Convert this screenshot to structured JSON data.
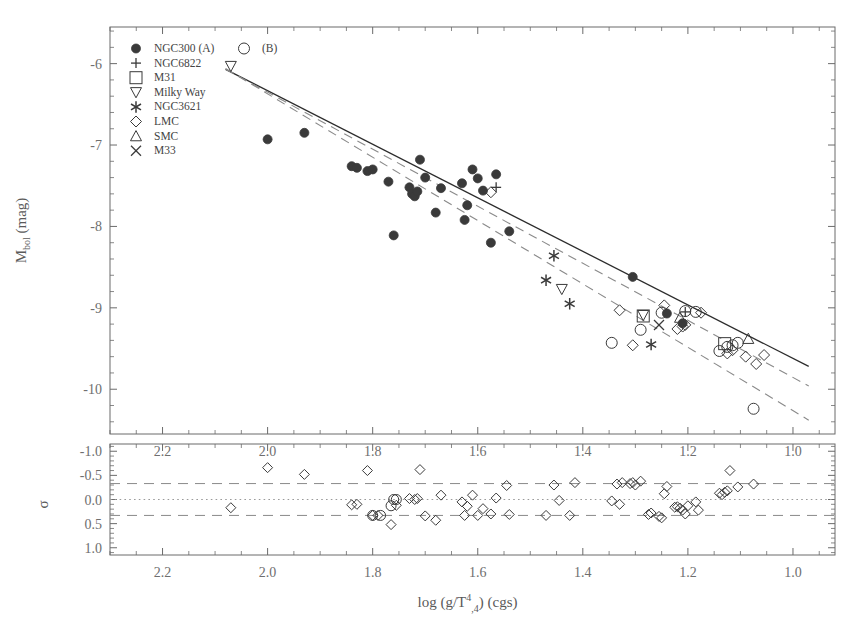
{
  "figure": {
    "title": "",
    "background": "#ffffff",
    "ink": "#3a3a3a"
  },
  "legend": {
    "position": "top-left-inside",
    "entries": [
      {
        "marker": "filled-circle",
        "label": "NGC300 (A)"
      },
      {
        "marker": "plus",
        "label": "NGC6822"
      },
      {
        "marker": "square",
        "label": "M31"
      },
      {
        "marker": "triangle-down",
        "label": "Milky Way"
      },
      {
        "marker": "asterisk",
        "label": "NGC3621"
      },
      {
        "marker": "diamond",
        "label": "LMC"
      },
      {
        "marker": "triangle-up",
        "label": "SMC"
      },
      {
        "marker": "cross",
        "label": "M33"
      }
    ],
    "extra": {
      "marker": "open-circle",
      "label": "(B)"
    }
  },
  "chart_data": [
    {
      "type": "scatter",
      "panel": "main",
      "title": "",
      "xlabel": "log (g/T⁴,4)  (cgs)",
      "ylabel": "M_bol (mag)",
      "xlabel_parts": {
        "pre": "log (g/T",
        "sup": "4",
        "sub": ",4",
        "post": ")  (cgs)"
      },
      "ylabel_parts": {
        "pre": "M",
        "sub": "bol",
        "post": " (mag)"
      },
      "xlim": [
        2.3,
        0.92
      ],
      "ylim": [
        -5.55,
        -10.55
      ],
      "x_ticks": [
        2.2,
        2.0,
        1.8,
        1.6,
        1.4,
        1.2,
        1.0
      ],
      "y_ticks": [
        -10,
        -9,
        -8,
        -7,
        -6
      ],
      "x_minor_step": 0.05,
      "y_minor_step": 0.2,
      "grid": false,
      "inverted_x": true,
      "inverted_y": true,
      "fit_lines": [
        {
          "name": "best-fit",
          "style": "solid",
          "color": "#2c2c2c",
          "x1": 2.08,
          "y1": -6.07,
          "x2": 0.97,
          "y2": -9.72
        },
        {
          "name": "comparison-A",
          "style": "dashed",
          "color": "#8a8a8a",
          "x1": 2.08,
          "y1": -6.07,
          "x2": 0.97,
          "y2": -9.96
        },
        {
          "name": "comparison-B",
          "style": "dashed",
          "color": "#8a8a8a",
          "x1": 2.08,
          "y1": -6.06,
          "x2": 0.97,
          "y2": -10.38
        }
      ],
      "series": [
        {
          "name": "NGC300 (A)",
          "marker": "filled-circle",
          "points": [
            [
              2.0,
              -6.93
            ],
            [
              1.93,
              -6.85
            ],
            [
              1.84,
              -7.26
            ],
            [
              1.83,
              -7.28
            ],
            [
              1.81,
              -7.32
            ],
            [
              1.8,
              -7.3
            ],
            [
              1.77,
              -7.45
            ],
            [
              1.76,
              -8.11
            ],
            [
              1.73,
              -7.52
            ],
            [
              1.725,
              -7.6
            ],
            [
              1.72,
              -7.63
            ],
            [
              1.715,
              -7.57
            ],
            [
              1.71,
              -7.18
            ],
            [
              1.7,
              -7.4
            ],
            [
              1.68,
              -7.83
            ],
            [
              1.67,
              -7.53
            ],
            [
              1.63,
              -7.47
            ],
            [
              1.625,
              -7.92
            ],
            [
              1.62,
              -7.74
            ],
            [
              1.61,
              -7.3
            ],
            [
              1.6,
              -7.41
            ],
            [
              1.59,
              -7.56
            ],
            [
              1.575,
              -8.2
            ],
            [
              1.565,
              -7.36
            ],
            [
              1.54,
              -8.06
            ],
            [
              1.305,
              -8.62
            ],
            [
              1.24,
              -9.07
            ],
            [
              1.21,
              -9.19
            ]
          ]
        },
        {
          "name": "NGC6822",
          "marker": "plus",
          "points": [
            [
              1.565,
              -7.52
            ],
            [
              1.205,
              -9.05
            ]
          ]
        },
        {
          "name": "M31",
          "marker": "square",
          "points": [
            [
              1.285,
              -9.1
            ],
            [
              1.13,
              -9.44
            ]
          ]
        },
        {
          "name": "Milky Way",
          "marker": "triangle-down",
          "points": [
            [
              2.07,
              -6.03
            ],
            [
              1.44,
              -8.77
            ],
            [
              1.285,
              -9.09
            ]
          ]
        },
        {
          "name": "NGC3621",
          "marker": "asterisk",
          "points": [
            [
              1.47,
              -8.66
            ],
            [
              1.425,
              -8.95
            ],
            [
              1.455,
              -8.36
            ],
            [
              1.27,
              -9.45
            ]
          ]
        },
        {
          "name": "LMC",
          "marker": "diamond",
          "points": [
            [
              1.575,
              -7.58
            ],
            [
              1.33,
              -9.03
            ],
            [
              1.305,
              -9.46
            ],
            [
              1.245,
              -8.97
            ],
            [
              1.22,
              -9.26
            ],
            [
              1.21,
              -9.23
            ],
            [
              1.205,
              -9.21
            ],
            [
              1.175,
              -9.06
            ],
            [
              1.125,
              -9.56
            ],
            [
              1.09,
              -9.6
            ],
            [
              1.07,
              -9.69
            ],
            [
              1.055,
              -9.58
            ],
            [
              1.115,
              -9.52
            ]
          ]
        },
        {
          "name": "SMC",
          "marker": "triangle-up",
          "points": [
            [
              1.215,
              -9.12
            ],
            [
              1.085,
              -9.38
            ]
          ]
        },
        {
          "name": "M33",
          "marker": "cross",
          "points": [
            [
              1.255,
              -9.21
            ]
          ]
        },
        {
          "name": "(B)",
          "marker": "open-circle",
          "points": [
            [
              1.345,
              -9.43
            ],
            [
              1.29,
              -9.27
            ],
            [
              1.25,
              -9.06
            ],
            [
              1.205,
              -9.04
            ],
            [
              1.185,
              -9.05
            ],
            [
              1.14,
              -9.53
            ],
            [
              1.125,
              -9.48
            ],
            [
              1.115,
              -9.46
            ],
            [
              1.105,
              -9.43
            ],
            [
              1.075,
              -10.24
            ]
          ]
        }
      ]
    },
    {
      "type": "scatter",
      "panel": "residual",
      "title": "",
      "xlabel": "log (g/T⁴,4)  (cgs)",
      "ylabel": "σ",
      "xlim": [
        2.3,
        0.92
      ],
      "ylim": [
        -1.15,
        1.15
      ],
      "x_ticks": [
        2.2,
        2.0,
        1.8,
        1.6,
        1.4,
        1.2,
        1.0
      ],
      "y_ticks": [
        1.0,
        0.5,
        0.0,
        -0.5,
        -1.0
      ],
      "x_minor_step": 0.05,
      "y_minor_step": 0.1,
      "grid": false,
      "reference_lines": [
        {
          "name": "zero-line",
          "style": "dotted",
          "color": "#9a9a9a",
          "y": 0.0
        },
        {
          "name": "upper-sigma",
          "style": "dashed",
          "color": "#8a8a8a",
          "y": 0.33
        },
        {
          "name": "lower-sigma",
          "style": "dashed",
          "color": "#8a8a8a",
          "y": -0.33
        }
      ],
      "series": [
        {
          "name": "residuals",
          "marker": "diamond",
          "points": [
            [
              2.07,
              0.17
            ],
            [
              2.0,
              -0.66
            ],
            [
              1.93,
              -0.52
            ],
            [
              1.84,
              0.11
            ],
            [
              1.83,
              0.1
            ],
            [
              1.81,
              -0.6
            ],
            [
              1.8,
              0.33
            ],
            [
              1.79,
              0.33
            ],
            [
              1.765,
              0.52
            ],
            [
              1.755,
              0.12
            ],
            [
              1.73,
              -0.02
            ],
            [
              1.72,
              0.0
            ],
            [
              1.715,
              -0.02
            ],
            [
              1.71,
              -0.62
            ],
            [
              1.7,
              0.34
            ],
            [
              1.68,
              0.43
            ],
            [
              1.67,
              -0.09
            ],
            [
              1.63,
              0.05
            ],
            [
              1.625,
              0.33
            ],
            [
              1.62,
              0.14
            ],
            [
              1.61,
              -0.09
            ],
            [
              1.6,
              0.33
            ],
            [
              1.59,
              0.19
            ],
            [
              1.575,
              0.3
            ],
            [
              1.565,
              -0.03
            ],
            [
              1.545,
              -0.29
            ],
            [
              1.54,
              0.31
            ],
            [
              1.47,
              0.33
            ],
            [
              1.455,
              -0.3
            ],
            [
              1.445,
              0.02
            ],
            [
              1.425,
              0.33
            ],
            [
              1.415,
              -0.35
            ],
            [
              1.345,
              0.03
            ],
            [
              1.335,
              -0.32
            ],
            [
              1.33,
              0.1
            ],
            [
              1.325,
              -0.35
            ],
            [
              1.31,
              -0.33
            ],
            [
              1.305,
              -0.35
            ],
            [
              1.3,
              -0.3
            ],
            [
              1.29,
              -0.38
            ],
            [
              1.275,
              0.31
            ],
            [
              1.27,
              0.28
            ],
            [
              1.255,
              0.35
            ],
            [
              1.25,
              0.38
            ],
            [
              1.245,
              -0.12
            ],
            [
              1.24,
              -0.27
            ],
            [
              1.225,
              0.16
            ],
            [
              1.22,
              0.15
            ],
            [
              1.215,
              0.18
            ],
            [
              1.21,
              0.22
            ],
            [
              1.205,
              0.3
            ],
            [
              1.2,
              0.13
            ],
            [
              1.185,
              0.05
            ],
            [
              1.18,
              0.22
            ],
            [
              1.14,
              -0.13
            ],
            [
              1.135,
              -0.1
            ],
            [
              1.13,
              -0.15
            ],
            [
              1.125,
              -0.18
            ],
            [
              1.12,
              -0.6
            ],
            [
              1.105,
              -0.26
            ],
            [
              1.075,
              -0.32
            ]
          ]
        },
        {
          "name": "residuals-overlap-circles",
          "marker": "open-circle",
          "points": [
            [
              1.8,
              0.33
            ],
            [
              1.785,
              0.33
            ],
            [
              1.765,
              0.13
            ],
            [
              1.76,
              0.0
            ],
            [
              1.755,
              0.0
            ]
          ]
        }
      ]
    }
  ],
  "axes": {
    "main": {
      "x_tick_labels": [
        "2.2",
        "2.0",
        "1.8",
        "1.6",
        "1.4",
        "1.2",
        "1.0"
      ],
      "y_tick_labels": [
        "-10",
        "-9",
        "-8",
        "-7",
        "-6"
      ]
    },
    "residual": {
      "x_tick_labels": [
        "2.2",
        "2.0",
        "1.8",
        "1.6",
        "1.4",
        "1.2",
        "1.0"
      ],
      "y_tick_labels": [
        "1.0",
        "0.5",
        "0.0",
        "-0.5",
        "-1.0"
      ]
    }
  }
}
